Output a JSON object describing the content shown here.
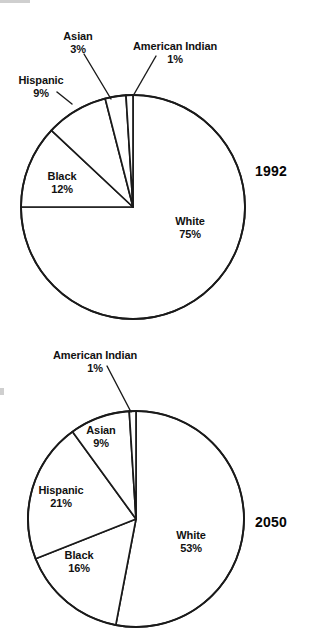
{
  "figure": {
    "background_color": "#ffffff",
    "line_color": "#1a1a1a",
    "text_color": "#111111"
  },
  "chart_data": [
    {
      "type": "pie",
      "title": "1992",
      "year_label": "1992",
      "labels": [
        "White",
        "Black",
        "Hispanic",
        "Asian",
        "American Indian"
      ],
      "values": [
        75,
        12,
        9,
        3,
        1
      ],
      "value_labels": [
        "75%",
        "12%",
        "9%",
        "3%",
        "1%"
      ],
      "units": "percent",
      "legend": "none",
      "grid": false,
      "start_angle_deg": -90,
      "direction": "clockwise",
      "slices": [
        {
          "label": "White",
          "value": 75,
          "value_label": "75%",
          "label_placement": "inside"
        },
        {
          "label": "Black",
          "value": 12,
          "value_label": "12%",
          "label_placement": "inside"
        },
        {
          "label": "Hispanic",
          "value": 9,
          "value_label": "9%",
          "label_placement": "outside-leader"
        },
        {
          "label": "Asian",
          "value": 3,
          "value_label": "3%",
          "label_placement": "outside-leader"
        },
        {
          "label": "American Indian",
          "value": 1,
          "value_label": "1%",
          "label_placement": "outside-leader"
        }
      ]
    },
    {
      "type": "pie",
      "title": "2050",
      "year_label": "2050",
      "labels": [
        "White",
        "Black",
        "Hispanic",
        "Asian",
        "American Indian"
      ],
      "values": [
        53,
        16,
        21,
        9,
        1
      ],
      "value_labels": [
        "53%",
        "16%",
        "21%",
        "9%",
        "1%"
      ],
      "units": "percent",
      "legend": "none",
      "grid": false,
      "start_angle_deg": -90,
      "direction": "clockwise",
      "slices": [
        {
          "label": "White",
          "value": 53,
          "value_label": "53%",
          "label_placement": "inside"
        },
        {
          "label": "Black",
          "value": 16,
          "value_label": "16%",
          "label_placement": "inside"
        },
        {
          "label": "Hispanic",
          "value": 21,
          "value_label": "21%",
          "label_placement": "inside"
        },
        {
          "label": "Asian",
          "value": 9,
          "value_label": "9%",
          "label_placement": "inside"
        },
        {
          "label": "American Indian",
          "value": 1,
          "value_label": "1%",
          "label_placement": "outside-leader"
        }
      ]
    }
  ],
  "charts": [
    {
      "id": "chart-1992",
      "year": "1992",
      "year_pos": {
        "x": 255,
        "y": 163
      },
      "center": {
        "x": 133,
        "y": 207
      },
      "radius": 112,
      "labels": [
        {
          "name": "White",
          "pct": "75%",
          "x": 190,
          "y": 215,
          "leader": null
        },
        {
          "name": "Black",
          "pct": "12%",
          "x": 62,
          "y": 170,
          "leader": null
        },
        {
          "name": "Hispanic",
          "pct": "9%",
          "x": 41,
          "y": 74,
          "leader": {
            "x1": 57,
            "y1": 92,
            "x2": 72,
            "y2": 104
          }
        },
        {
          "name": "Asian",
          "pct": "3%",
          "x": 78,
          "y": 30,
          "leader": {
            "x1": 84,
            "y1": 54,
            "x2": 111,
            "y2": 99
          }
        },
        {
          "name": "American Indian",
          "pct": "1%",
          "x": 175,
          "y": 40,
          "leader": {
            "x1": 156,
            "y1": 56,
            "x2": 133,
            "y2": 96
          }
        }
      ]
    },
    {
      "id": "chart-2050",
      "year": "2050",
      "year_pos": {
        "x": 255,
        "y": 514
      },
      "center": {
        "x": 136,
        "y": 519
      },
      "radius": 108,
      "labels": [
        {
          "name": "White",
          "pct": "53%",
          "x": 191,
          "y": 529,
          "leader": null
        },
        {
          "name": "Black",
          "pct": "16%",
          "x": 79,
          "y": 549,
          "leader": null
        },
        {
          "name": "Hispanic",
          "pct": "21%",
          "x": 61,
          "y": 484,
          "leader": null
        },
        {
          "name": "Asian",
          "pct": "9%",
          "x": 101,
          "y": 424,
          "leader": null
        },
        {
          "name": "American Indian",
          "pct": "1%",
          "x": 95,
          "y": 349,
          "leader": {
            "x1": 107,
            "y1": 366,
            "x2": 131,
            "y2": 412
          }
        }
      ]
    }
  ]
}
